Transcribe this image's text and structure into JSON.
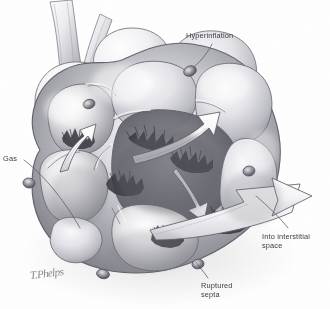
{
  "figure": {
    "medium": "grayscale pencil and airbrush medical illustration",
    "background_color": "#ffffff",
    "label_color": "#3c3c42",
    "ink_color": "#4a4a50",
    "width": 330,
    "height": 309
  },
  "labels": {
    "hyperinflation": "Hyperinflation",
    "gas": "Gas",
    "into_interstitial_space": "Into interstitial\nspace",
    "ruptured_septa": "Ruptured\nsepta"
  },
  "signature": {
    "text": "T.Phelps"
  },
  "anatomy": {
    "structures": [
      "terminal bronchiole",
      "alveolar duct",
      "alveolar sac cluster",
      "interalveolar septa",
      "pores of Kohn",
      "ruptured septal edges",
      "interstitial space"
    ],
    "pore_count": 5,
    "arrow_count": 4,
    "arrow_meaning": "escaping gas flow"
  }
}
